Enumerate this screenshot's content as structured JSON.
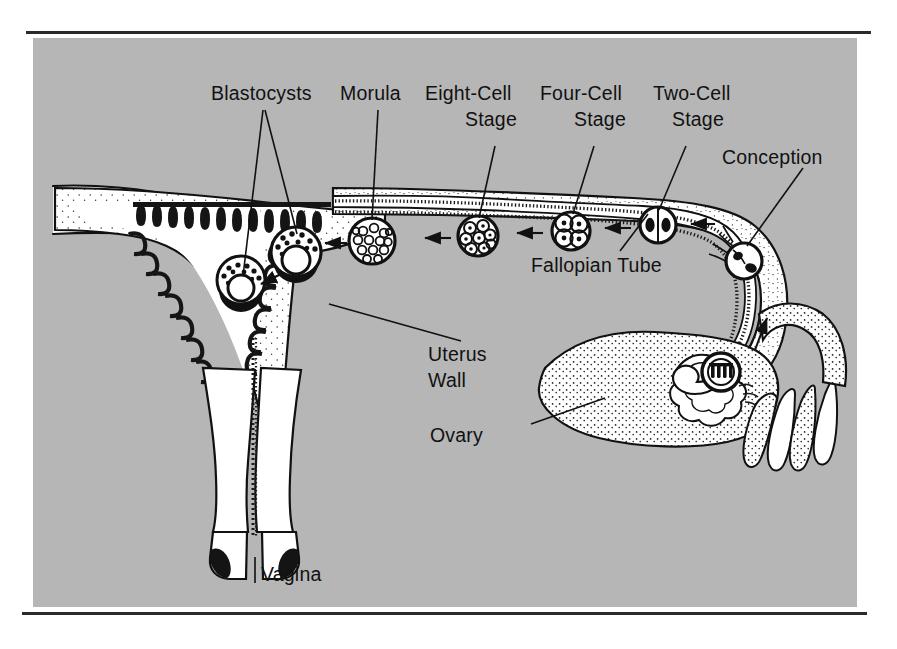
{
  "figure": {
    "background_color": "#b6b6b6",
    "page_color": "#ffffff",
    "ink_color": "#111111",
    "organ_fill": "#ffffff"
  },
  "rules": {
    "top": "horizontal-rule",
    "bottom": "horizontal-rule"
  },
  "labels": [
    {
      "id": "blastocysts",
      "text": "Blastocysts",
      "lines": [
        "Blastocysts"
      ],
      "x": 211,
      "y": 95,
      "anchor": "start"
    },
    {
      "id": "morula",
      "text": "Morula",
      "lines": [
        "Morula"
      ],
      "x": 340,
      "y": 95,
      "anchor": "start"
    },
    {
      "id": "eight-cell",
      "text": "Eight-Cell Stage",
      "lines": [
        "Eight-Cell",
        "Stage"
      ],
      "x": 425,
      "y": 95,
      "anchor": "start"
    },
    {
      "id": "four-cell",
      "text": "Four-Cell Stage",
      "lines": [
        "Four-Cell",
        "Stage"
      ],
      "x": 540,
      "y": 95,
      "anchor": "start"
    },
    {
      "id": "two-cell",
      "text": "Two-Cell Stage",
      "lines": [
        "Two-Cell",
        "Stage"
      ],
      "x": 653,
      "y": 95,
      "anchor": "start"
    },
    {
      "id": "conception",
      "text": "Conception",
      "lines": [
        "Conception"
      ],
      "x": 722,
      "y": 159,
      "anchor": "start"
    },
    {
      "id": "fallopian-tube",
      "text": "Fallopian Tube",
      "lines": [
        "Fallopian Tube"
      ],
      "x": 531,
      "y": 267,
      "anchor": "start"
    },
    {
      "id": "uterus-wall",
      "text": "Uterus Wall",
      "lines": [
        "Uterus",
        "Wall"
      ],
      "x": 428,
      "y": 356,
      "anchor": "start"
    },
    {
      "id": "ovary",
      "text": "Ovary",
      "lines": [
        "Ovary"
      ],
      "x": 430,
      "y": 437,
      "anchor": "start"
    },
    {
      "id": "vagina",
      "text": "Vagina",
      "lines": [
        "Vagina"
      ],
      "x": 261,
      "y": 576,
      "anchor": "start"
    }
  ],
  "label_lines": {
    "eight_cell_second": "Stage",
    "four_cell_second": "Stage",
    "two_cell_second": "Stage",
    "uterus_second": "Wall"
  },
  "anatomy": {
    "parts": [
      {
        "name": "uterus-body",
        "label": "Uterus"
      },
      {
        "name": "uterine-cavity",
        "label": "Uterine cavity"
      },
      {
        "name": "endometrium",
        "label": "Endometrium lining"
      },
      {
        "name": "cervical-canal",
        "label": "Cervical canal"
      },
      {
        "name": "vaginal-canal",
        "label": "Vagina"
      },
      {
        "name": "fallopian-tube",
        "label": "Fallopian Tube"
      },
      {
        "name": "fimbriae",
        "label": "Fimbriae"
      },
      {
        "name": "ovary",
        "label": "Ovary"
      }
    ]
  },
  "stages": [
    {
      "name": "conception",
      "label": "Conception",
      "cells": 1,
      "cx": 784,
      "cy": 232,
      "r": 17
    },
    {
      "name": "ovum-release",
      "label": "Ovum release",
      "cells": 1,
      "cx": 758,
      "cy": 341,
      "r": 18
    },
    {
      "name": "two-cell-stage",
      "label": "Two-Cell Stage",
      "cells": 2,
      "cx": 697,
      "cy": 197,
      "r": 17
    },
    {
      "name": "four-cell-stage",
      "label": "Four-Cell Stage",
      "cells": 4,
      "cx": 619,
      "cy": 203,
      "r": 19
    },
    {
      "name": "eight-cell-stage",
      "label": "Eight-Cell Stage",
      "cells": 8,
      "cx": 528,
      "cy": 208,
      "r": 20
    },
    {
      "name": "morula",
      "label": "Morula",
      "cells": 24,
      "cx": 422,
      "cy": 213,
      "r": 23
    },
    {
      "name": "blastocyst-tubal",
      "label": "Blastocyst",
      "cells": 0,
      "cx": 349,
      "cy": 221,
      "r": 25
    },
    {
      "name": "blastocyst-implanted",
      "label": "Blastocyst",
      "cells": 0,
      "cx": 294,
      "cy": 250,
      "r": 24
    }
  ],
  "flow_arrows": {
    "count": 6,
    "direction": "right-to-left-toward-uterus",
    "ovulation_arrow": "upward"
  }
}
